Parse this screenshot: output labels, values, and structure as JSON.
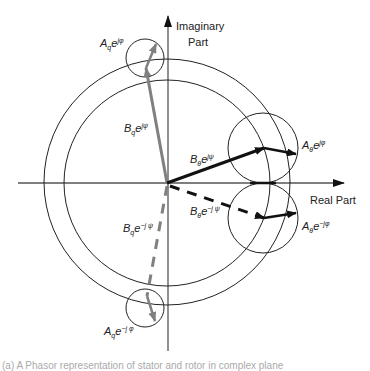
{
  "axes": {
    "imaginary_label_line1": "Imaginary",
    "imaginary_label_line2": "Part",
    "real_label": "Real Part"
  },
  "labels": {
    "Aq_pos": {
      "base": "A",
      "sub": "q",
      "exp": "e",
      "sup": "jφ",
      "supsub": "q"
    },
    "Bq_pos": {
      "base": "B",
      "sub": "q",
      "exp": "e",
      "sup": "jψ",
      "supsub": "q"
    },
    "Bq_neg": {
      "base": "B",
      "sub": "q",
      "exp": "e",
      "sup": "−j ψ",
      "supsub": "q"
    },
    "Aq_neg": {
      "base": "A",
      "sub": "q",
      "exp": "e",
      "sup": "−j φ",
      "supsub": "q"
    },
    "Bth_pos": {
      "base": "B",
      "sub": "θ",
      "exp": "e",
      "sup": "jψ",
      "supsub": "θ"
    },
    "Ath_pos": {
      "base": "A",
      "sub": "θ",
      "exp": "e",
      "sup": "jφ",
      "supsub": "θ"
    },
    "Bth_neg": {
      "base": "B",
      "sub": "θ",
      "exp": "e",
      "sup": "−j ψ",
      "supsub": "θ"
    },
    "Ath_neg": {
      "base": "A",
      "sub": "θ",
      "exp": "e",
      "sup": "−jφ",
      "supsub": "θ"
    }
  },
  "colors": {
    "line": "#222222",
    "gray_vector": "#808080",
    "axis": "#555555"
  },
  "caption": "(a) A Phasor representation of stator and rotor in complex plane"
}
